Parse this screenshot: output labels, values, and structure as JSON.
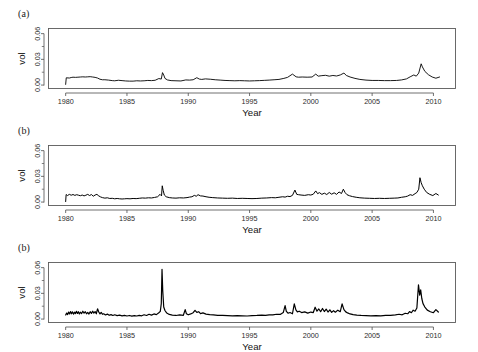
{
  "figure": {
    "background_color": "#ffffff",
    "line_color": "#000000",
    "axis_color": "#4d4d4d",
    "frame_color": "#5a5a5a"
  },
  "chart_data": [
    {
      "type": "line",
      "panel_label": "(a)",
      "title": "",
      "xlabel": "Year",
      "ylabel": "vol",
      "xlim": [
        1978.6,
        2011.8
      ],
      "ylim": [
        -0.004,
        0.066
      ],
      "grid": false,
      "legend": null,
      "xticks": [
        1980,
        1985,
        1990,
        1995,
        2000,
        2005,
        2010
      ],
      "xticklabels": [
        "1980",
        "1985",
        "1990",
        "1995",
        "2000",
        "2005",
        "2010"
      ],
      "yticks": [
        0.0,
        0.03,
        0.06
      ],
      "yticklabels": [
        "0.00",
        "0.03",
        "0.06"
      ],
      "yticks_minor": [
        0.015,
        0.045
      ],
      "line_width": 0.9,
      "x": [
        1980.0,
        1980.05,
        1980.3,
        1980.45,
        1980.6,
        1980.8,
        1981.0,
        1981.2,
        1981.4,
        1981.6,
        1981.8,
        1982.0,
        1982.2,
        1982.4,
        1982.6,
        1982.8,
        1983.0,
        1983.2,
        1983.5,
        1983.8,
        1984.0,
        1984.3,
        1984.6,
        1984.9,
        1985.2,
        1985.5,
        1985.8,
        1986.1,
        1986.4,
        1986.7,
        1987.0,
        1987.3,
        1987.6,
        1987.8,
        1987.9,
        1988.0,
        1988.1,
        1988.3,
        1988.6,
        1989.0,
        1989.4,
        1989.8,
        1990.1,
        1990.4,
        1990.7,
        1990.9,
        1991.1,
        1991.4,
        1991.8,
        1992.2,
        1992.6,
        1993.0,
        1993.4,
        1993.8,
        1994.2,
        1994.6,
        1995.0,
        1995.4,
        1995.8,
        1996.2,
        1996.6,
        1997.0,
        1997.4,
        1997.8,
        1998.1,
        1998.5,
        1998.8,
        1999.0,
        1999.3,
        1999.7,
        2000.1,
        2000.4,
        2000.6,
        2000.9,
        2001.2,
        2001.5,
        2001.8,
        2002.1,
        2002.4,
        2002.7,
        2002.9,
        2003.2,
        2003.6,
        2004.0,
        2004.5,
        2005.0,
        2005.5,
        2006.0,
        2006.5,
        2007.0,
        2007.4,
        2007.8,
        2008.1,
        2008.4,
        2008.6,
        2008.8,
        2009.0,
        2009.1,
        2009.3,
        2009.6,
        2009.9,
        2010.2,
        2010.5,
        2010.7
      ],
      "values": [
        0.0008,
        0.0085,
        0.0082,
        0.0088,
        0.0092,
        0.009,
        0.0092,
        0.0094,
        0.0096,
        0.0094,
        0.0096,
        0.0098,
        0.0094,
        0.009,
        0.0082,
        0.0068,
        0.0062,
        0.0062,
        0.0058,
        0.0052,
        0.005,
        0.0056,
        0.0052,
        0.0048,
        0.0046,
        0.0046,
        0.005,
        0.0048,
        0.005,
        0.0054,
        0.0052,
        0.0056,
        0.0076,
        0.007,
        0.0145,
        0.0118,
        0.0078,
        0.006,
        0.0052,
        0.005,
        0.0048,
        0.006,
        0.0058,
        0.0062,
        0.0086,
        0.007,
        0.0066,
        0.0072,
        0.0068,
        0.0062,
        0.0058,
        0.0054,
        0.0052,
        0.005,
        0.0052,
        0.005,
        0.0048,
        0.005,
        0.0052,
        0.0055,
        0.0058,
        0.0062,
        0.0066,
        0.0078,
        0.009,
        0.0128,
        0.0096,
        0.0092,
        0.0094,
        0.0092,
        0.0094,
        0.0128,
        0.0104,
        0.011,
        0.0114,
        0.0104,
        0.0112,
        0.0106,
        0.0118,
        0.014,
        0.0112,
        0.0094,
        0.0078,
        0.0066,
        0.0058,
        0.0054,
        0.0054,
        0.0052,
        0.0052,
        0.0054,
        0.006,
        0.0072,
        0.0096,
        0.0118,
        0.0104,
        0.014,
        0.0248,
        0.0212,
        0.016,
        0.012,
        0.0094,
        0.008,
        0.0094
      ]
    },
    {
      "type": "line",
      "panel_label": "(b)",
      "title": "",
      "xlabel": "Year",
      "ylabel": "vol",
      "xlim": [
        1978.6,
        2011.8
      ],
      "ylim": [
        -0.004,
        0.066
      ],
      "grid": false,
      "legend": null,
      "xticks": [
        1980,
        1985,
        1990,
        1995,
        2000,
        2005,
        2010
      ],
      "xticklabels": [
        "1980",
        "1985",
        "1990",
        "1995",
        "2000",
        "2005",
        "2010"
      ],
      "yticks": [
        0.0,
        0.03,
        0.06
      ],
      "yticklabels": [
        "0.00",
        "0.03",
        "0.06"
      ],
      "yticks_minor": [
        0.015,
        0.045
      ],
      "line_width": 1.0,
      "x": [
        1980.0,
        1980.04,
        1980.15,
        1980.3,
        1980.45,
        1980.6,
        1980.75,
        1980.9,
        1981.05,
        1981.2,
        1981.35,
        1981.5,
        1981.65,
        1981.8,
        1981.95,
        1982.1,
        1982.25,
        1982.4,
        1982.55,
        1982.7,
        1982.85,
        1983.0,
        1983.2,
        1983.4,
        1983.6,
        1983.8,
        1984.0,
        1984.2,
        1984.4,
        1984.6,
        1984.8,
        1985.0,
        1985.25,
        1985.5,
        1985.75,
        1986.0,
        1986.25,
        1986.5,
        1986.75,
        1987.0,
        1987.25,
        1987.5,
        1987.7,
        1987.82,
        1987.88,
        1987.95,
        1988.05,
        1988.2,
        1988.45,
        1988.7,
        1989.0,
        1989.3,
        1989.6,
        1989.9,
        1990.1,
        1990.3,
        1990.5,
        1990.65,
        1990.8,
        1991.0,
        1991.2,
        1991.45,
        1991.7,
        1992.0,
        1992.4,
        1992.8,
        1993.2,
        1993.6,
        1994.0,
        1994.4,
        1994.8,
        1995.2,
        1995.6,
        1996.0,
        1996.4,
        1996.8,
        1997.1,
        1997.4,
        1997.7,
        1997.9,
        1998.1,
        1998.3,
        1998.5,
        1998.7,
        1998.85,
        1999.0,
        1999.2,
        1999.5,
        1999.8,
        2000.0,
        2000.2,
        2000.4,
        2000.55,
        2000.7,
        2000.9,
        2001.1,
        2001.3,
        2001.5,
        2001.7,
        2001.9,
        2002.1,
        2002.3,
        2002.5,
        2002.65,
        2002.8,
        2002.95,
        2003.15,
        2003.4,
        2003.7,
        2004.0,
        2004.4,
        2004.8,
        2005.2,
        2005.6,
        2006.0,
        2006.4,
        2006.8,
        2007.1,
        2007.4,
        2007.7,
        2007.9,
        2008.1,
        2008.3,
        2008.5,
        2008.65,
        2008.8,
        2008.9,
        2009.0,
        2009.1,
        2009.25,
        2009.45,
        2009.7,
        2009.95,
        2010.2,
        2010.4,
        2010.55,
        2010.7
      ],
      "values": [
        0.0006,
        0.0088,
        0.0076,
        0.009,
        0.008,
        0.0088,
        0.0078,
        0.0086,
        0.008,
        0.0074,
        0.0082,
        0.0072,
        0.008,
        0.009,
        0.0076,
        0.0088,
        0.0068,
        0.0082,
        0.009,
        0.0072,
        0.006,
        0.0052,
        0.0046,
        0.005,
        0.0042,
        0.0044,
        0.0038,
        0.0042,
        0.0038,
        0.0036,
        0.0038,
        0.004,
        0.0038,
        0.0042,
        0.004,
        0.0044,
        0.0048,
        0.0046,
        0.005,
        0.0048,
        0.0054,
        0.0062,
        0.009,
        0.0072,
        0.019,
        0.0138,
        0.0082,
        0.0062,
        0.0052,
        0.0048,
        0.0046,
        0.005,
        0.0048,
        0.0052,
        0.0058,
        0.0062,
        0.0078,
        0.0068,
        0.0086,
        0.0072,
        0.007,
        0.0062,
        0.0056,
        0.0052,
        0.0048,
        0.0046,
        0.0044,
        0.0046,
        0.0042,
        0.0044,
        0.0042,
        0.004,
        0.0042,
        0.0046,
        0.0048,
        0.0052,
        0.005,
        0.0056,
        0.0062,
        0.0058,
        0.0068,
        0.0064,
        0.0078,
        0.014,
        0.009,
        0.0086,
        0.0082,
        0.0078,
        0.0086,
        0.0082,
        0.0092,
        0.013,
        0.0098,
        0.011,
        0.009,
        0.0104,
        0.0088,
        0.0112,
        0.0092,
        0.0108,
        0.009,
        0.0118,
        0.01,
        0.015,
        0.011,
        0.0086,
        0.0074,
        0.0064,
        0.0056,
        0.005,
        0.0046,
        0.0044,
        0.0042,
        0.0044,
        0.0042,
        0.0044,
        0.0046,
        0.0048,
        0.0056,
        0.0062,
        0.007,
        0.0086,
        0.0078,
        0.0098,
        0.0112,
        0.015,
        0.0284,
        0.0226,
        0.019,
        0.015,
        0.0112,
        0.009,
        0.0076,
        0.01,
        0.0082
      ]
    },
    {
      "type": "line",
      "panel_label": "(b)",
      "title": "",
      "xlabel": "Year",
      "ylabel": "vol",
      "xlim": [
        1978.6,
        2011.8
      ],
      "ylim": [
        -0.004,
        0.066
      ],
      "grid": false,
      "legend": null,
      "xticks": [
        1980,
        1985,
        1990,
        1995,
        2000,
        2005,
        2010
      ],
      "xticklabels": [
        "1980",
        "1985",
        "1990",
        "1995",
        "2000",
        "2005",
        "2010"
      ],
      "yticks": [
        0.0,
        0.03,
        0.06
      ],
      "yticklabels": [
        "0.00",
        "0.03",
        "0.06"
      ],
      "yticks_minor": [
        0.015,
        0.045
      ],
      "line_width": 1.2,
      "x": [
        1980.0,
        1980.08,
        1980.16,
        1980.24,
        1980.32,
        1980.4,
        1980.48,
        1980.56,
        1980.64,
        1980.72,
        1980.8,
        1980.88,
        1980.96,
        1981.04,
        1981.12,
        1981.2,
        1981.3,
        1981.4,
        1981.5,
        1981.6,
        1981.7,
        1981.8,
        1981.9,
        1982.0,
        1982.1,
        1982.2,
        1982.3,
        1982.4,
        1982.5,
        1982.6,
        1982.7,
        1982.8,
        1982.9,
        1983.0,
        1983.1,
        1983.25,
        1983.4,
        1983.55,
        1983.7,
        1983.85,
        1984.0,
        1984.2,
        1984.4,
        1984.6,
        1984.8,
        1985.0,
        1985.2,
        1985.4,
        1985.6,
        1985.8,
        1986.0,
        1986.2,
        1986.4,
        1986.6,
        1986.8,
        1987.0,
        1987.2,
        1987.4,
        1987.6,
        1987.72,
        1987.8,
        1987.86,
        1987.92,
        1988.0,
        1988.1,
        1988.25,
        1988.45,
        1988.7,
        1989.0,
        1989.3,
        1989.6,
        1989.75,
        1989.85,
        1990.0,
        1990.2,
        1990.4,
        1990.55,
        1990.7,
        1990.85,
        1991.0,
        1991.2,
        1991.45,
        1991.75,
        1992.05,
        1992.4,
        1992.8,
        1993.2,
        1993.6,
        1994.0,
        1994.4,
        1994.8,
        1995.2,
        1995.6,
        1996.0,
        1996.3,
        1996.6,
        1996.9,
        1997.2,
        1997.5,
        1997.75,
        1997.9,
        1998.0,
        1998.15,
        1998.3,
        1998.5,
        1998.65,
        1998.78,
        1998.9,
        1999.05,
        1999.25,
        1999.5,
        1999.75,
        2000.0,
        2000.2,
        2000.35,
        2000.5,
        2000.65,
        2000.8,
        2000.95,
        2001.1,
        2001.25,
        2001.4,
        2001.55,
        2001.7,
        2001.85,
        2002.0,
        2002.2,
        2002.4,
        2002.55,
        2002.7,
        2002.85,
        2003.0,
        2003.2,
        2003.45,
        2003.75,
        2004.1,
        2004.5,
        2004.9,
        2005.3,
        2005.7,
        2006.1,
        2006.5,
        2006.9,
        2007.2,
        2007.45,
        2007.7,
        2007.9,
        2008.05,
        2008.2,
        2008.35,
        2008.5,
        2008.65,
        2008.78,
        2008.88,
        2008.96,
        2009.05,
        2009.15,
        2009.3,
        2009.5,
        2009.75,
        2010.0,
        2010.2,
        2010.4,
        2010.55,
        2010.7
      ],
      "values": [
        0.0048,
        0.007,
        0.0052,
        0.0082,
        0.006,
        0.0088,
        0.0062,
        0.0084,
        0.0058,
        0.008,
        0.0064,
        0.009,
        0.0066,
        0.0086,
        0.006,
        0.008,
        0.0064,
        0.0092,
        0.0068,
        0.0086,
        0.0062,
        0.0078,
        0.0058,
        0.0086,
        0.0066,
        0.0092,
        0.007,
        0.0088,
        0.0062,
        0.012,
        0.0082,
        0.006,
        0.0078,
        0.0056,
        0.0062,
        0.0048,
        0.0058,
        0.0044,
        0.0052,
        0.0042,
        0.005,
        0.004,
        0.0046,
        0.0038,
        0.0044,
        0.0036,
        0.0042,
        0.0034,
        0.004,
        0.0036,
        0.0044,
        0.0038,
        0.005,
        0.0042,
        0.0056,
        0.0046,
        0.006,
        0.0052,
        0.0074,
        0.009,
        0.018,
        0.058,
        0.033,
        0.014,
        0.01,
        0.007,
        0.0054,
        0.0046,
        0.0042,
        0.0048,
        0.0044,
        0.011,
        0.0062,
        0.005,
        0.006,
        0.0074,
        0.0102,
        0.0078,
        0.0086,
        0.0064,
        0.0072,
        0.0058,
        0.0052,
        0.0048,
        0.0044,
        0.0042,
        0.004,
        0.0038,
        0.004,
        0.0038,
        0.0036,
        0.004,
        0.0042,
        0.0046,
        0.0044,
        0.005,
        0.0048,
        0.0056,
        0.0054,
        0.0076,
        0.0156,
        0.009,
        0.0068,
        0.0076,
        0.0062,
        0.0178,
        0.0108,
        0.0084,
        0.0092,
        0.0076,
        0.0084,
        0.007,
        0.0082,
        0.0076,
        0.0138,
        0.0092,
        0.0118,
        0.0086,
        0.0124,
        0.0088,
        0.0116,
        0.0082,
        0.0108,
        0.0078,
        0.0098,
        0.008,
        0.0104,
        0.0086,
        0.0178,
        0.011,
        0.0084,
        0.0072,
        0.006,
        0.0052,
        0.0046,
        0.0042,
        0.004,
        0.0038,
        0.004,
        0.0038,
        0.0042,
        0.0044,
        0.0048,
        0.0056,
        0.005,
        0.0068,
        0.0062,
        0.0088,
        0.0074,
        0.0104,
        0.0092,
        0.013,
        0.04,
        0.028,
        0.034,
        0.024,
        0.018,
        0.014,
        0.0104,
        0.0086,
        0.0074,
        0.011,
        0.0082
      ]
    }
  ]
}
